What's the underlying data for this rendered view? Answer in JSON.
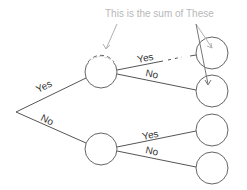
{
  "diagram": {
    "type": "decision-tree",
    "annotation": {
      "text": "This is the sum of These",
      "color": "#b8b8b8"
    },
    "root": {
      "x": 16,
      "y": 112
    },
    "nodes": [
      {
        "id": "upper-mid",
        "x": 101,
        "y": 72,
        "r": 16
      },
      {
        "id": "lower-mid",
        "x": 101,
        "y": 149,
        "r": 16
      },
      {
        "id": "leaf-1",
        "x": 212,
        "y": 53,
        "r": 16
      },
      {
        "id": "leaf-2",
        "x": 212,
        "y": 91,
        "r": 16
      },
      {
        "id": "leaf-3",
        "x": 212,
        "y": 130,
        "r": 16
      },
      {
        "id": "leaf-4",
        "x": 212,
        "y": 168,
        "r": 16
      }
    ],
    "edges": [
      {
        "from": "root",
        "to": "upper-mid",
        "label": "Yes"
      },
      {
        "from": "root",
        "to": "lower-mid",
        "label": "No"
      },
      {
        "from": "upper-mid",
        "to": "leaf-1",
        "label": "Yes"
      },
      {
        "from": "upper-mid",
        "to": "leaf-2",
        "label": "No"
      },
      {
        "from": "lower-mid",
        "to": "leaf-3",
        "label": "Yes"
      },
      {
        "from": "lower-mid",
        "to": "leaf-4",
        "label": "No"
      }
    ],
    "labels": {
      "root_yes": "Yes",
      "root_no": "No",
      "upper_yes": "Yes",
      "upper_no": "No",
      "lower_yes": "Yes",
      "lower_no": "No"
    }
  }
}
